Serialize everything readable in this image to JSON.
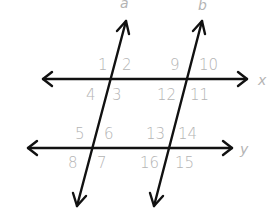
{
  "diagram": {
    "lines": {
      "a": {
        "label": "a",
        "kind": "transversal"
      },
      "b": {
        "label": "b",
        "kind": "transversal"
      },
      "x": {
        "label": "x",
        "kind": "parallel"
      },
      "y": {
        "label": "y",
        "kind": "parallel"
      }
    },
    "angles": {
      "a_x": [
        "1",
        "2",
        "3",
        "4"
      ],
      "b_x": [
        "9",
        "10",
        "11",
        "12"
      ],
      "a_y": [
        "5",
        "6",
        "7",
        "8"
      ],
      "b_y": [
        "13",
        "14",
        "15",
        "16"
      ]
    },
    "colors": {
      "line": "#111111",
      "label": "#b4b4b4",
      "background": "#ffffff"
    }
  }
}
